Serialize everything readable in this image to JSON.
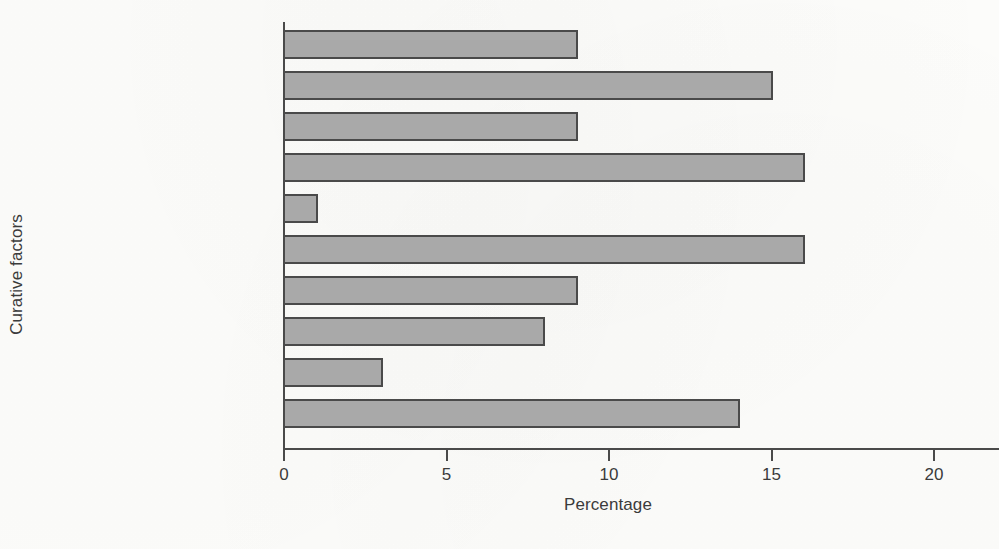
{
  "chart_data": {
    "type": "bar",
    "orientation": "horizontal",
    "title": "",
    "xlabel": "Percentage",
    "ylabel": "Curative factors",
    "categories": [
      "Hope",
      "Universality",
      "Vicarious learning",
      "Interpersonal learning",
      "Guidance",
      "Cohesion",
      "Self-disclosure",
      "Catharsis",
      "Altruism",
      "Insight"
    ],
    "values": [
      9,
      15,
      9,
      16,
      1,
      16,
      9,
      8,
      3,
      14
    ],
    "xlim": [
      0,
      20
    ],
    "xticks": [
      0,
      5,
      10,
      15,
      20
    ],
    "xtick_labels": [
      "0",
      "5",
      "10",
      "15",
      "20"
    ],
    "grid": false,
    "legend": false,
    "bar_fill_color": "#a9a9a9",
    "bar_edge_color": "#4a4a4a",
    "axis_color": "#4a4a4a",
    "background_color": "#fdfdfb",
    "text_color": "#3b3b3b"
  }
}
